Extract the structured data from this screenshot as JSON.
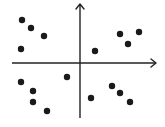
{
  "diagram": {
    "type": "scatter-quadrants",
    "width": 165,
    "height": 127,
    "colors": {
      "background": "#ffffff",
      "axis": "#222222",
      "point": "#1a1a1a"
    },
    "axes": {
      "x_axis": {
        "x1": 12,
        "y1": 63,
        "x2": 156,
        "y2": 63,
        "arrow": "right"
      },
      "y_axis": {
        "x1": 80,
        "y1": 118,
        "x2": 80,
        "y2": 4,
        "arrow": "up"
      }
    },
    "point_radius": 3.2,
    "points": [
      {
        "quadrant": "II",
        "x": 22,
        "y": 20
      },
      {
        "quadrant": "II",
        "x": 31,
        "y": 28
      },
      {
        "quadrant": "II",
        "x": 44,
        "y": 36
      },
      {
        "quadrant": "II",
        "x": 21,
        "y": 49
      },
      {
        "quadrant": "I",
        "x": 95,
        "y": 51
      },
      {
        "quadrant": "I",
        "x": 120,
        "y": 34
      },
      {
        "quadrant": "I",
        "x": 139,
        "y": 32
      },
      {
        "quadrant": "I",
        "x": 128,
        "y": 44
      },
      {
        "quadrant": "III",
        "x": 21,
        "y": 82
      },
      {
        "quadrant": "III",
        "x": 33,
        "y": 91
      },
      {
        "quadrant": "III",
        "x": 33,
        "y": 102
      },
      {
        "quadrant": "III",
        "x": 47,
        "y": 111
      },
      {
        "quadrant": "III",
        "x": 67,
        "y": 77
      },
      {
        "quadrant": "IV",
        "x": 91,
        "y": 98
      },
      {
        "quadrant": "IV",
        "x": 112,
        "y": 86
      },
      {
        "quadrant": "IV",
        "x": 120,
        "y": 93
      },
      {
        "quadrant": "IV",
        "x": 130,
        "y": 102
      }
    ]
  }
}
